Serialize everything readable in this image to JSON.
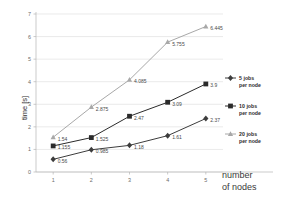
{
  "chart_data": {
    "type": "line",
    "title": "",
    "xlabel": "number of nodes",
    "ylabel": "time [s]",
    "x": [
      1,
      2,
      3,
      4,
      5
    ],
    "categories": [
      "1",
      "2",
      "3",
      "4",
      "5"
    ],
    "xlim": [
      0.55,
      5.45
    ],
    "ylim": [
      0,
      7
    ],
    "yticks": [
      "0",
      "1",
      "2",
      "3",
      "4",
      "5",
      "6",
      "7"
    ],
    "grid": true,
    "legend_position": "right",
    "series": [
      {
        "name": "5 jobs per node",
        "values": [
          0.56,
          0.985,
          1.18,
          1.61,
          2.37
        ],
        "labels": [
          "0.56",
          "0.985",
          "1.18",
          "1.61",
          "2.37"
        ],
        "color": "#3d3d3d",
        "marker": "diamond"
      },
      {
        "name": "10 jobs per node",
        "values": [
          1.155,
          1.525,
          2.47,
          3.09,
          3.9
        ],
        "labels": [
          "1.155",
          "1.525",
          "2.47",
          "3.09",
          "3.9"
        ],
        "color": "#2b2b2b",
        "marker": "square"
      },
      {
        "name": "20 jobs per node",
        "values": [
          1.54,
          2.875,
          4.085,
          5.755,
          6.445
        ],
        "labels": [
          "1.54",
          "2.875",
          "4.085",
          "5.755",
          "6.445"
        ],
        "color": "#a8a8a8",
        "marker": "triangle"
      }
    ]
  },
  "axis": {
    "x_title": "number",
    "x_title_line2": "of nodes",
    "y_title": "time [s]"
  },
  "legend": {
    "entries": [
      {
        "count": "5",
        "unit": "jobs",
        "sub": "per node",
        "color": "#3d3d3d",
        "marker": "diamond"
      },
      {
        "count": "10",
        "unit": "jobs",
        "sub": "per node",
        "color": "#2b2b2b",
        "marker": "square"
      },
      {
        "count": "20",
        "unit": "jobs",
        "sub": "per node",
        "color": "#a8a8a8",
        "marker": "triangle"
      }
    ]
  },
  "colors": {
    "grid": "#dcdcdc",
    "axis": "#b4b4b4",
    "background": "#ffffff",
    "series_5": "#3d3d3d",
    "series_10": "#2b2b2b",
    "series_20": "#a8a8a8"
  }
}
